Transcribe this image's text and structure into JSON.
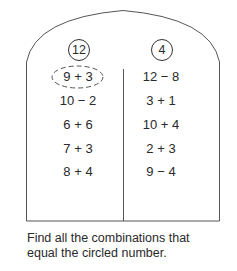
{
  "columns": [
    {
      "target": "12",
      "expressions": [
        "9 + 3",
        "10 − 2",
        "6 + 6",
        "7 + 3",
        "8 + 4"
      ],
      "example_circled_index": 0
    },
    {
      "target": "4",
      "expressions": [
        "12 − 8",
        "3 + 1",
        "10 + 4",
        "2 + 3",
        "9 − 4"
      ]
    }
  ],
  "instruction": {
    "line1": "Find all the combinations that",
    "line2": "equal the circled number."
  }
}
